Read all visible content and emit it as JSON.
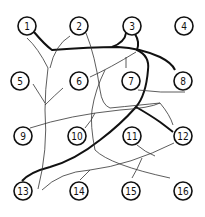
{
  "diagram": {
    "type": "maze-puzzle",
    "nodes": [
      {
        "id": "1",
        "x": 27,
        "y": 26
      },
      {
        "id": "2",
        "x": 79,
        "y": 26
      },
      {
        "id": "3",
        "x": 132,
        "y": 26
      },
      {
        "id": "4",
        "x": 184,
        "y": 26
      },
      {
        "id": "5",
        "x": 20,
        "y": 81
      },
      {
        "id": "6",
        "x": 79,
        "y": 81
      },
      {
        "id": "7",
        "x": 131,
        "y": 81
      },
      {
        "id": "8",
        "x": 183,
        "y": 81
      },
      {
        "id": "9",
        "x": 23,
        "y": 136
      },
      {
        "id": "10",
        "x": 77,
        "y": 136
      },
      {
        "id": "11",
        "x": 132,
        "y": 136
      },
      {
        "id": "12",
        "x": 183,
        "y": 136
      },
      {
        "id": "13",
        "x": 23,
        "y": 191
      },
      {
        "id": "14",
        "x": 79,
        "y": 191
      },
      {
        "id": "15",
        "x": 131,
        "y": 191
      },
      {
        "id": "16",
        "x": 183,
        "y": 191
      }
    ]
  }
}
